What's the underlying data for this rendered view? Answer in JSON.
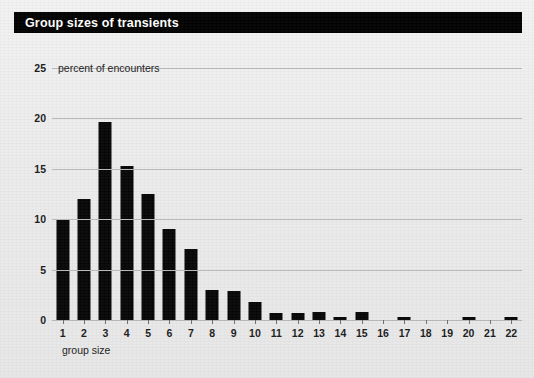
{
  "header": {
    "title": "Group sizes of transients"
  },
  "chart_data": {
    "type": "bar",
    "title": "Group sizes of transients",
    "xlabel": "group size",
    "ylabel": "percent of encounters",
    "ylabel_inline": "percent of encounters",
    "categories": [
      "1",
      "2",
      "3",
      "4",
      "5",
      "6",
      "7",
      "8",
      "9",
      "10",
      "11",
      "12",
      "13",
      "14",
      "15",
      "16",
      "17",
      "18",
      "19",
      "20",
      "21",
      "22"
    ],
    "values": [
      10.0,
      12.0,
      19.6,
      15.3,
      12.5,
      9.0,
      7.0,
      3.0,
      2.9,
      1.8,
      0.7,
      0.7,
      0.8,
      0.3,
      0.8,
      0.0,
      0.3,
      0.0,
      0.0,
      0.3,
      0.0,
      0.3
    ],
    "ylim": [
      0,
      25
    ],
    "yticks": [
      0,
      5,
      10,
      15,
      20,
      25
    ],
    "ytick_labels": [
      "0",
      "5",
      "10",
      "15",
      "20",
      "25"
    ],
    "xlim_labels": [
      "1",
      "22"
    ],
    "grid": true,
    "legend": "none",
    "bar_color": "#050505",
    "background_color": "#ececec",
    "gridline_color": "#b9b9b9",
    "title_bar_color": "#000000",
    "title_text_color": "#ffffff"
  }
}
